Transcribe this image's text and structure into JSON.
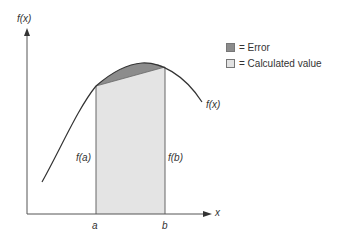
{
  "diagram": {
    "y_axis_label": "f(x)",
    "x_axis_label": "x",
    "curve_label": "f(x)",
    "point_a_label": "a",
    "point_b_label": "b",
    "fa_label": "f(a)",
    "fb_label": "f(b)"
  },
  "legend": {
    "items": [
      {
        "label": "= Error",
        "color": "#8c8c8c"
      },
      {
        "label": "= Calculated value",
        "color": "#e2e2e2"
      }
    ]
  },
  "colors": {
    "axis": "#555555",
    "curve": "#333333",
    "error_fill": "#8c8c8c",
    "calculated_fill": "#e4e4e4"
  }
}
